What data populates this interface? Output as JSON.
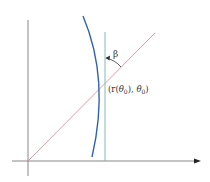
{
  "diagram": {
    "angle_label": "β",
    "point_label": {
      "open": "(r(",
      "theta": "θ",
      "sub1": "0",
      "mid": "), ",
      "theta2": "θ",
      "sub2": "0",
      "close": ")"
    },
    "colors": {
      "axes": "#7a7a7a",
      "radial_line": "#e0909a",
      "tangent_vertical": "#6fb8a8",
      "curve": "#2f63b0",
      "text": "#333333"
    }
  }
}
